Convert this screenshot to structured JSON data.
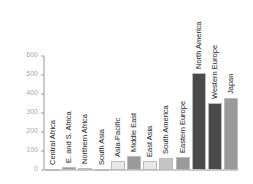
{
  "chart_data": {
    "type": "bar",
    "title": "",
    "xlabel": "",
    "ylabel": "",
    "ylim": [
      0,
      600
    ],
    "yticks": [
      0,
      100,
      200,
      300,
      400,
      500,
      600
    ],
    "grid": false,
    "categories": [
      "Central Africa",
      "E. and S. Africa",
      "Northern Africa",
      "South Asia",
      "Asia-Pacific",
      "Middle East",
      "East Asia",
      "South America",
      "Eastern Europe",
      "North America",
      "Western Europe",
      "Japan"
    ],
    "values": [
      5,
      18,
      12,
      7,
      47,
      74,
      47,
      63,
      68,
      510,
      352,
      379
    ],
    "colors": [
      "#9a9a9a",
      "#9a9a9a",
      "#b0b0b0",
      "#b0b0b0",
      "#e8e8e8",
      "#9a9a9a",
      "#e8e8e8",
      "#c4c4c4",
      "#9a9a9a",
      "#4a4a4a",
      "#4a4a4a",
      "#9a9a9a"
    ]
  }
}
